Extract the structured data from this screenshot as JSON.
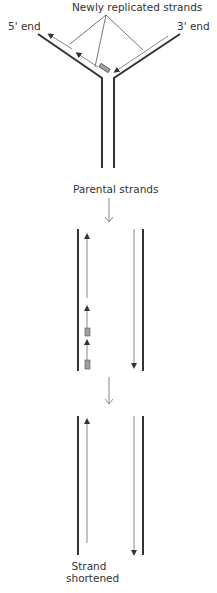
{
  "labels": {
    "newly_replicated": "Newly replicated strands",
    "five_prime_end": "5' end",
    "three_prime_end": "3' end",
    "parental_strands": "Parental strands",
    "strand_shortened_line1": "Strand",
    "strand_shortened_line2": "shortened"
  },
  "colors": {
    "parental_strand": "#333333",
    "new_strand": "#8a8a8a",
    "primer_fill": "#a0a0a0",
    "label_text": "#333333",
    "arrow": "#888888"
  },
  "diagram": {
    "stages": [
      "replication-fork",
      "lagging-strand-with-primers",
      "primers-removed-strand-shortened"
    ]
  }
}
